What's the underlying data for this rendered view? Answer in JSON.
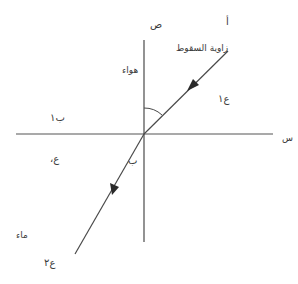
{
  "diagram": {
    "colors": {
      "line": "#4a4a4a",
      "text": "#3a3a3a",
      "background": "#ffffff"
    },
    "labels": {
      "y_axis": "ص",
      "point_a": "أ",
      "incidence_angle": "زاوية السقوط",
      "air": "هواء",
      "angle_1": "ع١",
      "point_b1": "ب١",
      "x_axis": "س",
      "angle_left": "ع،",
      "point_b": "ب",
      "water": "ماء",
      "angle_2": "ع٢"
    },
    "geometry": {
      "normal_line": {
        "x1": 144,
        "y1": 40,
        "x2": 144,
        "y2": 242
      },
      "surface_line": {
        "x1": 16,
        "y1": 134,
        "x2": 273,
        "y2": 134
      },
      "incident_ray": {
        "x1": 228,
        "y1": 51,
        "x2": 144,
        "y2": 134
      },
      "refracted_ray": {
        "x1": 144,
        "y1": 134,
        "x2": 75,
        "y2": 254
      }
    }
  }
}
